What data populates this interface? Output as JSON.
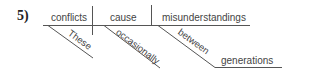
{
  "problem_number": "5)",
  "diagram": {
    "type": "sentence-diagram",
    "subject": "conflicts",
    "verb": "cause",
    "direct_object": "misunderstandings",
    "modifiers": {
      "subject_modifier": "These",
      "verb_modifier": "occasionally",
      "preposition": "between",
      "prepositional_object": "generations"
    }
  }
}
